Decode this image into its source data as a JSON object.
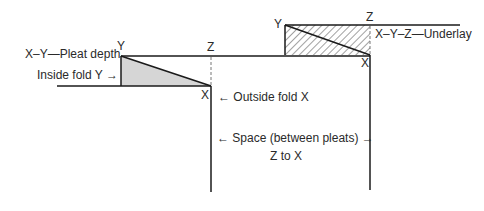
{
  "diagram": {
    "labels": {
      "left_y": "Y",
      "left_z": "Z",
      "left_x": "X",
      "right_y": "Y",
      "right_z": "Z",
      "right_x": "X",
      "pleat_depth": "X–Y—Pleat depth",
      "inside_fold": "Inside fold Y",
      "outside_fold": "Outside fold X",
      "underlay": "X–Y–Z—Underlay",
      "space": "Space (between pleats)",
      "space_sub": "Z to X"
    },
    "arrows": {
      "right": "→",
      "left": "←"
    },
    "colors": {
      "line": "#1a1a1a",
      "shade": "#d9d9d9",
      "hatch": "#333333"
    }
  }
}
